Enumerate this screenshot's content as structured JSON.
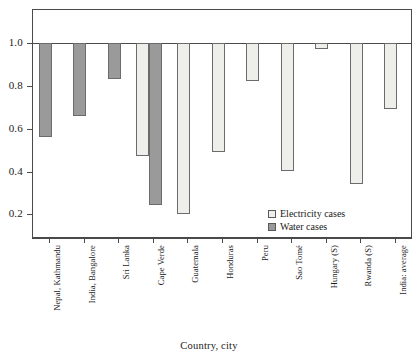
{
  "chart_data": {
    "type": "bar",
    "title": "",
    "xlabel": "Country, city",
    "ylabel": "",
    "categories": [
      "Nepal, Kathmandu",
      "India, Bangalore",
      "Sri Lanka",
      "Cape Verde",
      "Guatemala",
      "Honduras",
      "Peru",
      "Sao Tomé",
      "Hungary (S)",
      "Rwanda (S)",
      "India: average"
    ],
    "series": [
      {
        "name": "Electricity cases",
        "color": "#eeeeea",
        "values": [
          null,
          null,
          null,
          0.47,
          0.2,
          0.49,
          0.82,
          0.4,
          0.97,
          0.34,
          0.69
        ]
      },
      {
        "name": "Water cases",
        "color": "#9a9a9a",
        "values": [
          0.56,
          0.66,
          0.83,
          0.24,
          null,
          null,
          null,
          null,
          null,
          null,
          null
        ]
      }
    ],
    "baseline": 1.0,
    "ylim": [
      0.1,
      1.08
    ],
    "yticks": [
      1.0,
      0.8,
      0.6,
      0.4,
      0.2
    ],
    "ytick_labels": [
      "1.0",
      "0.8",
      "0.6",
      "0.4",
      "0.2"
    ],
    "grid": false,
    "legend_position": "inside-bottom-right",
    "bar_direction": "downward-from-baseline"
  },
  "legend": {
    "items": [
      {
        "label": "Electricity cases",
        "swatch": "electricity"
      },
      {
        "label": "Water cases",
        "swatch": "water"
      }
    ]
  },
  "axis": {
    "x_title": "Country, city"
  }
}
